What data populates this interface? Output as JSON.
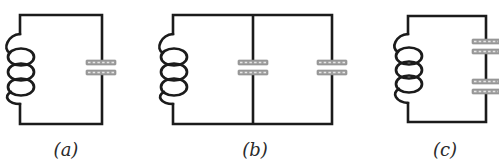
{
  "figure": {
    "type": "circuit-diagram",
    "background": "#ffffff",
    "colors": {
      "wire": "#1b1b1b",
      "capacitor_plate": "#9d9d9d",
      "label_text": "#2a2a2a"
    },
    "circuits": [
      {
        "id": "a",
        "label": "(a)",
        "components": [
          "inductor",
          "capacitor"
        ],
        "topology": "single inductor in loop with one capacitor"
      },
      {
        "id": "b",
        "label": "(b)",
        "components": [
          "inductor",
          "capacitor",
          "capacitor"
        ],
        "topology": "inductor with two capacitors in parallel branches"
      },
      {
        "id": "c",
        "label": "(c)",
        "components": [
          "inductor",
          "capacitor",
          "capacitor"
        ],
        "topology": "inductor with two capacitors in series on right branch"
      }
    ]
  }
}
